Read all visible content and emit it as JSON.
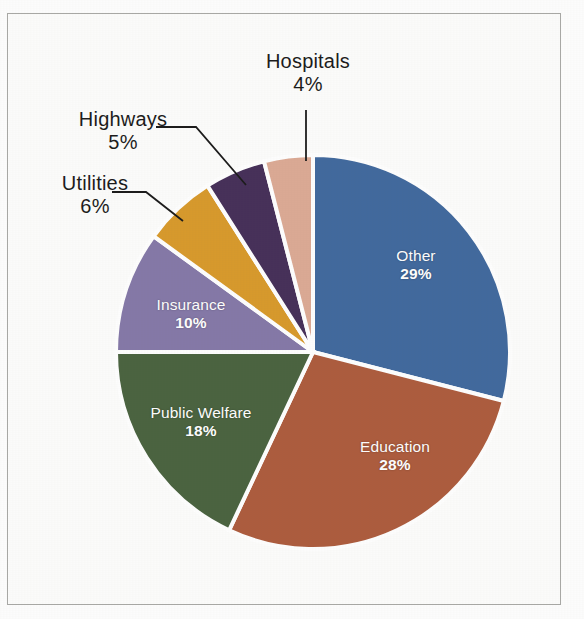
{
  "chart_data": {
    "type": "pie",
    "title": "",
    "subtitle": "",
    "xlabel": "",
    "ylabel": "",
    "legend_position": "none",
    "grid": false,
    "start_angle_deg": 0,
    "direction": "clockwise",
    "units": "percent",
    "categories": [
      "Other",
      "Education",
      "Public Welfare",
      "Insurance",
      "Utilities",
      "Highways",
      "Hospitals"
    ],
    "values": [
      29,
      28,
      18,
      10,
      6,
      5,
      4
    ],
    "colors": [
      "#41699e",
      "#ad5c3e",
      "#4a6340",
      "#8579a8",
      "#d89a2c",
      "#463059",
      "#dcaa95"
    ],
    "slices": [
      {
        "label": "Other",
        "value": 29,
        "value_text": "29%",
        "color": "#41699e",
        "label_placement": "inside",
        "label_text_color": "#ffffff"
      },
      {
        "label": "Education",
        "value": 28,
        "value_text": "28%",
        "color": "#ad5c3e",
        "label_placement": "inside",
        "label_text_color": "#ffffff"
      },
      {
        "label": "Public Welfare",
        "value": 18,
        "value_text": "18%",
        "color": "#4a6340",
        "label_placement": "inside",
        "label_text_color": "#ffffff"
      },
      {
        "label": "Insurance",
        "value": 10,
        "value_text": "10%",
        "color": "#8579a8",
        "label_placement": "inside",
        "label_text_color": "#ffffff"
      },
      {
        "label": "Utilities",
        "value": 6,
        "value_text": "6%",
        "color": "#d89a2c",
        "label_placement": "outside",
        "label_text_color": "#1b1b1b",
        "leader": "elbow-left"
      },
      {
        "label": "Highways",
        "value": 5,
        "value_text": "5%",
        "color": "#463059",
        "label_placement": "outside",
        "label_text_color": "#1b1b1b",
        "leader": "elbow-left"
      },
      {
        "label": "Hospitals",
        "value": 4,
        "value_text": "4%",
        "color": "#dcaa95",
        "label_placement": "outside",
        "label_text_color": "#1b1b1b",
        "leader": "vertical"
      }
    ]
  },
  "figure": {
    "background_color": "#fefefe",
    "border_color": "#a9a9a6",
    "slice_separator_color": "#ffffff"
  }
}
